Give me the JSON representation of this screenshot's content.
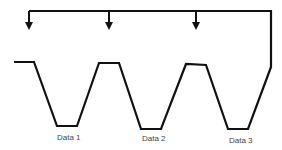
{
  "diagram": {
    "labels": [
      {
        "text": "Data 1",
        "x": 57,
        "y": 133
      },
      {
        "text": "Data 2",
        "x": 142,
        "y": 134
      },
      {
        "text": "Data 3",
        "x": 229,
        "y": 136
      }
    ],
    "waveform_points": [
      [
        14,
        62
      ],
      [
        34,
        62
      ],
      [
        57,
        126
      ],
      [
        77,
        126
      ],
      [
        99,
        63
      ],
      [
        119,
        63
      ],
      [
        141,
        129
      ],
      [
        161,
        129
      ],
      [
        186,
        64
      ],
      [
        206,
        65
      ],
      [
        228,
        129
      ],
      [
        248,
        129
      ],
      [
        271,
        67
      ]
    ],
    "feedback_bar": {
      "y": 11,
      "x_start": 29,
      "x_end": 271
    },
    "arrows_x": [
      29,
      109,
      196
    ],
    "arrow_bottom_y": 30,
    "stroke_color": "#111111"
  }
}
